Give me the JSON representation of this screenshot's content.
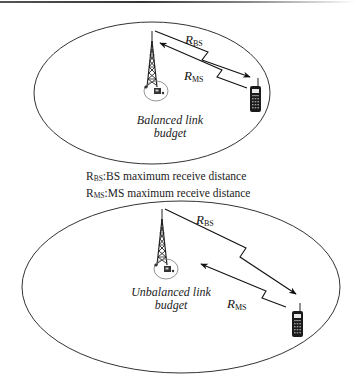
{
  "diagram": {
    "type": "link-budget-illustration",
    "top_panel": {
      "caption_line1": "Balanced link",
      "caption_line2": "budget",
      "label_bs_main": "R",
      "label_bs_sub": "BS",
      "label_ms_main": "R",
      "label_ms_sub": "MS",
      "icons": [
        "base-station-tower-icon",
        "mobile-phone-icon"
      ]
    },
    "legend": {
      "items": [
        {
          "symbol_main": "R",
          "symbol_sub": "BS",
          "text": ":BS maximum receive distance"
        },
        {
          "symbol_main": "R",
          "symbol_sub": "MS",
          "text": ":MS maximum receive distance"
        }
      ]
    },
    "bottom_panel": {
      "caption_line1": "Unbalanced link",
      "caption_line2": "budget",
      "label_bs_main": "R",
      "label_bs_sub": "BS",
      "label_ms_main": "R",
      "label_ms_sub": "MS",
      "icons": [
        "base-station-tower-icon",
        "mobile-phone-icon"
      ]
    },
    "colors": {
      "stroke": "#222222",
      "background": "#ffffff"
    }
  }
}
